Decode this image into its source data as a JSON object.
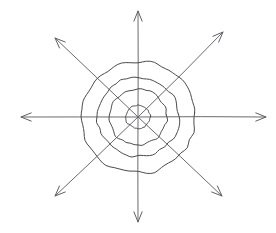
{
  "figure": {
    "style": "pencil sketch",
    "background_color": "#ffffff",
    "ring_color": "#4a4a50",
    "axis_color": "#6b6b70",
    "center": {
      "x": 138,
      "y": 117
    },
    "rings": [
      {
        "name": "innermost-ring",
        "radius": 12,
        "wobble": 0.9
      },
      {
        "name": "inner-ring",
        "radius": 29,
        "wobble": 1.6
      },
      {
        "name": "middle-ring",
        "radius": 41,
        "wobble": 2.0
      },
      {
        "name": "outer-ring",
        "radius": 58,
        "wobble": 2.6
      }
    ],
    "ring_count": 4,
    "arrow_count": 8,
    "arrows": [
      {
        "name": "arrow-up",
        "angle_deg": 270,
        "tip": {
          "x": 138,
          "y": 11
        },
        "length": 106
      },
      {
        "name": "arrow-up-right",
        "angle_deg": 315,
        "tip": {
          "x": 223,
          "y": 32
        },
        "length": 120
      },
      {
        "name": "arrow-right",
        "angle_deg": 0,
        "tip": {
          "x": 266,
          "y": 117
        },
        "length": 128
      },
      {
        "name": "arrow-down-right",
        "angle_deg": 45,
        "tip": {
          "x": 222,
          "y": 196
        },
        "length": 116
      },
      {
        "name": "arrow-down",
        "angle_deg": 90,
        "tip": {
          "x": 138,
          "y": 222
        },
        "length": 105
      },
      {
        "name": "arrow-down-left",
        "angle_deg": 135,
        "tip": {
          "x": 55,
          "y": 196
        },
        "length": 116
      },
      {
        "name": "arrow-left",
        "angle_deg": 180,
        "tip": {
          "x": 21,
          "y": 117
        },
        "length": 117
      },
      {
        "name": "arrow-up-left",
        "angle_deg": 225,
        "tip": {
          "x": 55,
          "y": 38
        },
        "length": 117
      }
    ],
    "arrowhead": {
      "length": 11,
      "spread_deg": 22
    }
  },
  "chart_data": {
    "type": "scatter",
    "title": "",
    "xlabel": "",
    "ylabel": "",
    "grid": false,
    "legend": null
  }
}
